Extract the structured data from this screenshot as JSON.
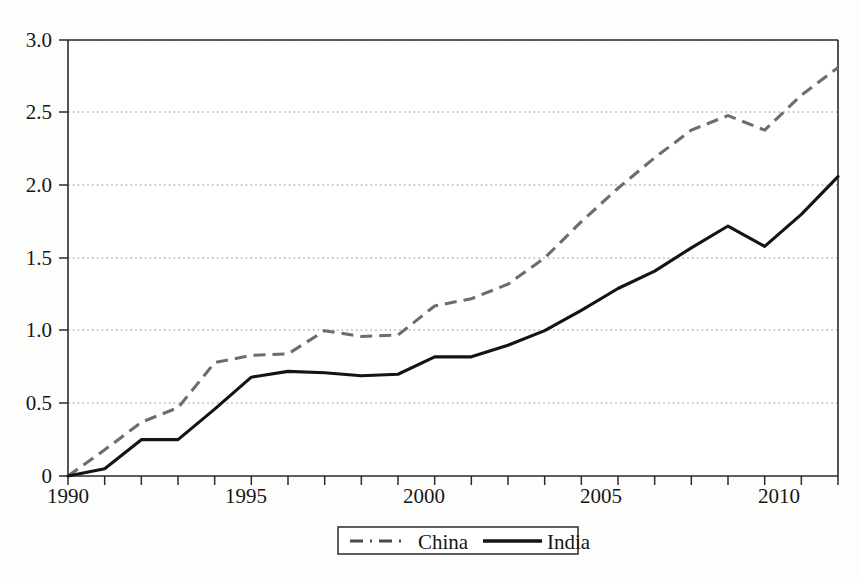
{
  "chart_data": {
    "type": "line",
    "title": "",
    "subtitle": "",
    "xlabel": "",
    "ylabel": "",
    "x": [
      1990,
      1991,
      1992,
      1993,
      1994,
      1995,
      1996,
      1997,
      1998,
      1999,
      2000,
      2001,
      2002,
      2003,
      2004,
      2005,
      2006,
      2007,
      2008,
      2009,
      2010,
      2011
    ],
    "xlim": [
      1990,
      2011
    ],
    "ylim": [
      0,
      3.0
    ],
    "xticks": [
      1990,
      1991,
      1992,
      1993,
      1994,
      1995,
      1996,
      1997,
      1998,
      1999,
      2000,
      2001,
      2002,
      2003,
      2004,
      2005,
      2006,
      2007,
      2008,
      2009,
      2010,
      2011
    ],
    "xticklabels": [
      "1990",
      "",
      "",
      "",
      "",
      "1995",
      "",
      "",
      "",
      "",
      "2000",
      "",
      "",
      "",
      "",
      "2005",
      "",
      "",
      "",
      "",
      "2010",
      ""
    ],
    "xtick_labels_shown": [
      "1990",
      "1995",
      "2000",
      "2005",
      "2010"
    ],
    "yticks": [
      0,
      0.5,
      1.0,
      1.5,
      2.0,
      2.5,
      3.0
    ],
    "yticklabels": [
      "0",
      "0.5",
      "1.0",
      "1.5",
      "2.0",
      "2.5",
      "3.0"
    ],
    "grid": true,
    "grid_axis": "y",
    "legend_position": "bottom-center",
    "series": [
      {
        "name": "China",
        "style": "dashed",
        "color": "#6d6d6d",
        "values": [
          0.0,
          0.18,
          0.37,
          0.47,
          0.78,
          0.83,
          0.84,
          1.0,
          0.96,
          0.97,
          1.17,
          1.22,
          1.32,
          1.5,
          1.75,
          1.98,
          2.19,
          2.38,
          2.48,
          2.38,
          2.62,
          2.81
        ]
      },
      {
        "name": "India",
        "style": "solid",
        "color": "#141414",
        "values": [
          0.0,
          0.05,
          0.25,
          0.25,
          0.46,
          0.68,
          0.72,
          0.71,
          0.69,
          0.7,
          0.82,
          0.82,
          0.9,
          1.0,
          1.14,
          1.29,
          1.41,
          1.57,
          1.72,
          1.58,
          1.8,
          2.06
        ]
      }
    ]
  },
  "legend": {
    "entries": [
      {
        "label": "China",
        "style": "dashed"
      },
      {
        "label": "India",
        "style": "solid"
      }
    ]
  },
  "axes": {
    "y_tick_labels": [
      "3.0",
      "2.5",
      "2.0",
      "1.5",
      "1.0",
      "0.5",
      "0"
    ],
    "x_tick_labels": [
      "1990",
      "1995",
      "2000",
      "2005",
      "2010"
    ]
  }
}
